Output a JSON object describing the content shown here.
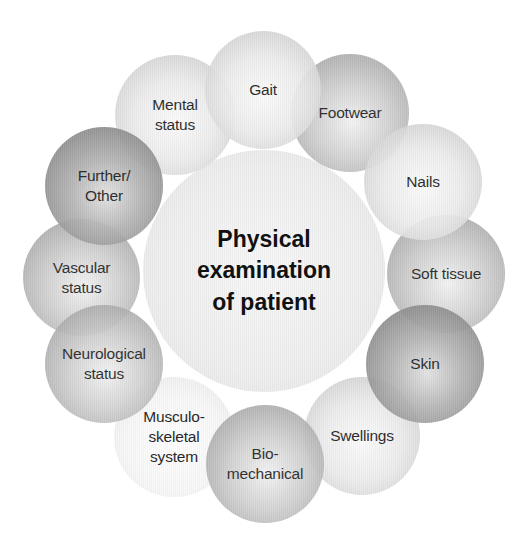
{
  "diagram": {
    "title": "Physical examination of patient",
    "center": {
      "label": "Physical\nexamination\nof patient"
    },
    "nodes": [
      {
        "id": "gait",
        "label": "Gait"
      },
      {
        "id": "footwear",
        "label": "Footwear"
      },
      {
        "id": "nails",
        "label": "Nails"
      },
      {
        "id": "soft-tissue",
        "label": "Soft tissue"
      },
      {
        "id": "skin",
        "label": "Skin"
      },
      {
        "id": "swellings",
        "label": "Swellings"
      },
      {
        "id": "bio-mechanical",
        "label": "Bio-\nmechanical"
      },
      {
        "id": "musculo-skeletal",
        "label": "Musculo-\nskeletal\nsystem"
      },
      {
        "id": "neurological-status",
        "label": "Neurological\nstatus"
      },
      {
        "id": "vascular-status",
        "label": "Vascular\nstatus"
      },
      {
        "id": "further-other",
        "label": "Further/\nOther"
      },
      {
        "id": "mental-status",
        "label": "Mental\nstatus"
      }
    ],
    "colors": {
      "background": "#ffffff",
      "text": "#1a1a1a",
      "light_gray": "#e8e8e8",
      "mid_gray": "#b8b8b8",
      "dark_gray": "#8c8c8c"
    }
  }
}
